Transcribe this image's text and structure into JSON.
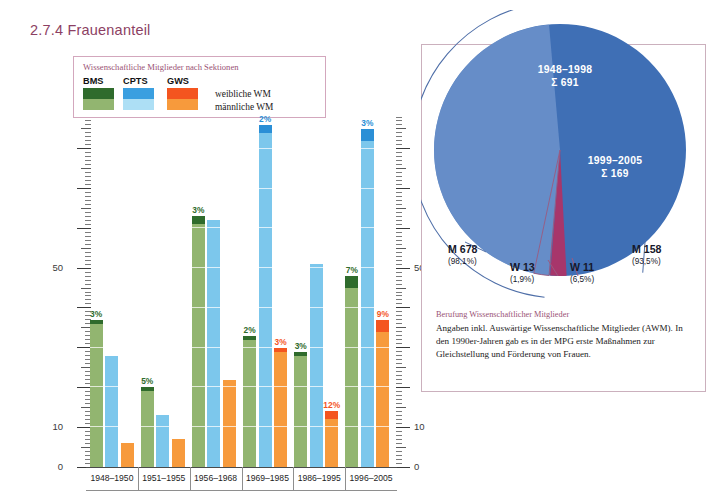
{
  "page": {
    "title": "2.7.4 Frauenanteil",
    "title_color": "#8c3f63"
  },
  "legend": {
    "title": "Wissenschaftliche Mitglieder nach Sektionen",
    "sections": [
      {
        "code": "BMS",
        "female_color": "#2f6b2c",
        "male_color": "#92b570"
      },
      {
        "code": "CPTS",
        "female_color": "#3a9fe0",
        "male_color": "#addff5"
      },
      {
        "code": "GWS",
        "female_color": "#f4551f",
        "male_color": "#f79a3c"
      }
    ],
    "rows": [
      {
        "label": "weibliche WM"
      },
      {
        "label": "männliche WM"
      }
    ]
  },
  "axis": {
    "ticks_labeled": [
      "50",
      "10",
      "0"
    ],
    "left_values": [
      50,
      10,
      0
    ],
    "right_values": [
      50,
      10,
      0
    ]
  },
  "chart_data": {
    "type": "bar",
    "title": "Wissenschaftliche Mitglieder nach Sektionen",
    "xlabel": "",
    "ylabel": "",
    "ylim": [
      0,
      88
    ],
    "grid": true,
    "legend_position": "top-left",
    "categories": [
      "1948–1950",
      "1951–1955",
      "1956–1968",
      "1969–1985",
      "1986–1995",
      "1996–2005"
    ],
    "series": [
      {
        "name": "BMS",
        "color": "#92b570",
        "female_color": "#2f6b2c",
        "totals": [
          37,
          20,
          63,
          33,
          29,
          48
        ],
        "female_pct": [
          "3%",
          "5%",
          "3%",
          "2%",
          "3%",
          "7%"
        ],
        "female_values": [
          1,
          1,
          2,
          1,
          1,
          3
        ]
      },
      {
        "name": "CPTS",
        "color": "#7cc7ec",
        "female_color": "#2b8fd6",
        "totals": [
          28,
          13,
          62,
          86,
          51,
          85
        ],
        "female_pct": [
          "",
          "",
          "",
          "2%",
          "",
          "3%"
        ],
        "female_values": [
          0,
          0,
          0,
          2,
          0,
          3
        ]
      },
      {
        "name": "GWS",
        "color": "#f79a3c",
        "female_color": "#f4551f",
        "totals": [
          6,
          7,
          22,
          30,
          14,
          37
        ],
        "female_pct": [
          "",
          "",
          "",
          "3%",
          "12%",
          "9%"
        ],
        "female_values": [
          0,
          0,
          0,
          1,
          2,
          3
        ]
      }
    ]
  },
  "pie": {
    "slices": [
      {
        "name": "1948-1998",
        "caption": "1948–1998",
        "sum_label": "Σ 691",
        "total": 691,
        "color": "#3f6fb5",
        "male": {
          "label": "M 678",
          "pct": "(98,1%)",
          "value": 678
        },
        "female": {
          "label": "W 13",
          "pct": "(1,9%)",
          "value": 13,
          "color": "#a7366b"
        }
      },
      {
        "name": "1999-2005",
        "caption": "1999–2005",
        "sum_label": "Σ 169",
        "total": 169,
        "color": "#7e9fd4",
        "male": {
          "label": "M 158",
          "pct": "(93,5%)",
          "value": 158
        },
        "female": {
          "label": "W 11",
          "pct": "(6,5%)",
          "value": 11,
          "color": "#ffffff"
        }
      }
    ],
    "note_head": "Berufung Wissenschaftlicher Mitglieder",
    "note_body": "Angaben inkl. Auswärtige Wissenschaftliche Mitglieder (AWM). In den 1990er-Jahren gab es in der MPG erste Maßnahmen zur Gleichstellung und Förderung von Frauen."
  }
}
